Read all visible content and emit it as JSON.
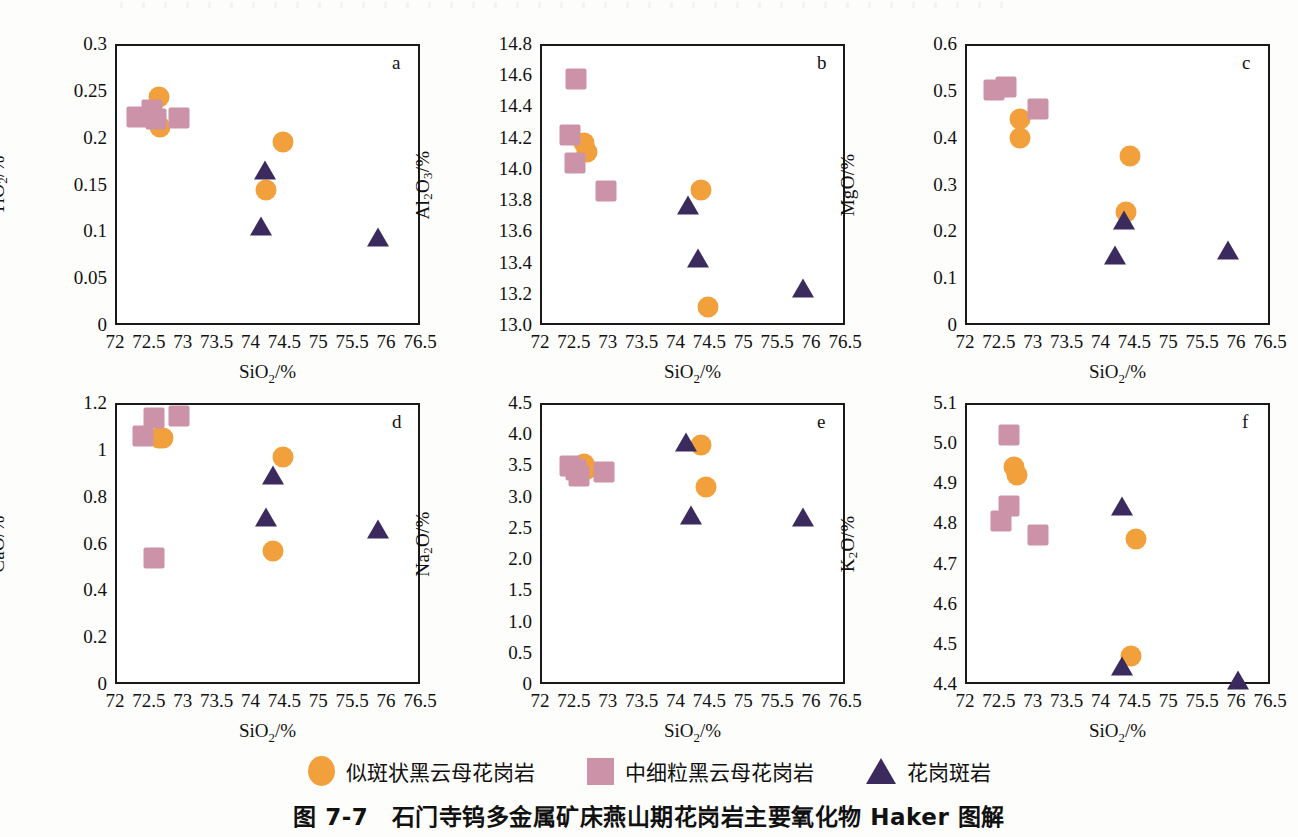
{
  "figure": {
    "caption": "图 7-7　石门寺钨多金属矿床燕山期花岗岩主要氧化物 Haker 图解"
  },
  "legend": {
    "items": [
      {
        "name": "circle-marker",
        "shape": "circle",
        "color": "#F2A03C",
        "label": "似斑状黑云母花岗岩"
      },
      {
        "name": "square-marker",
        "shape": "square",
        "color": "#CC92A8",
        "label": "中细粒黑云母花岗岩"
      },
      {
        "name": "triangle-marker",
        "shape": "triangle",
        "color": "#3B2A5E",
        "label": "花岗斑岩"
      }
    ]
  },
  "colors": {
    "porphyritic_biotite_granite": "#F2A03C",
    "medium_fine_biotite_granite": "#CC92A8",
    "granite_porphyry": "#3B2A5E",
    "axis": "#1a1a1a"
  },
  "chart_data": [
    {
      "id": "a",
      "type": "scatter",
      "letter": "a",
      "title": "",
      "xlabel": "SiO2/%",
      "ylabel": "TiO2/%",
      "xlim": [
        72,
        76.5
      ],
      "ylim": [
        0,
        0.3
      ],
      "xticks": [
        "72",
        "72.5",
        "73",
        "73.5",
        "74",
        "74.5",
        "75",
        "75.5",
        "76",
        "76.5"
      ],
      "xtick_values": [
        72,
        72.5,
        73,
        73.5,
        74,
        74.5,
        75,
        75.5,
        76,
        76.5
      ],
      "yticks": [
        "0",
        "0.05",
        "0.1",
        "0.15",
        "0.2",
        "0.25",
        "0.3"
      ],
      "ytick_values": [
        0,
        0.05,
        0.1,
        0.15,
        0.2,
        0.25,
        0.3
      ],
      "grid": false,
      "series": [
        {
          "name": "似斑状黑云母花岗岩",
          "marker": "circle",
          "color": "#F2A03C",
          "points": [
            [
              72.62,
              0.246
            ],
            [
              72.64,
              0.214
            ],
            [
              74.45,
              0.198
            ],
            [
              74.2,
              0.146
            ]
          ]
        },
        {
          "name": "中细粒黑云母花岗岩",
          "marker": "square",
          "color": "#CC92A8",
          "points": [
            [
              72.3,
              0.224
            ],
            [
              72.52,
              0.232
            ],
            [
              72.58,
              0.222
            ],
            [
              72.92,
              0.223
            ]
          ]
        },
        {
          "name": "花岗斑岩",
          "marker": "triangle",
          "color": "#3B2A5E",
          "points": [
            [
              74.18,
              0.171
            ],
            [
              74.12,
              0.111
            ],
            [
              75.85,
              0.099
            ]
          ]
        }
      ]
    },
    {
      "id": "b",
      "type": "scatter",
      "letter": "b",
      "title": "",
      "xlabel": "SiO2/%",
      "ylabel": "Al2O3/%",
      "xlim": [
        72,
        76.5
      ],
      "ylim": [
        13.0,
        14.8
      ],
      "xticks": [
        "72",
        "72.5",
        "73",
        "73.5",
        "74",
        "74.5",
        "75",
        "75.5",
        "76",
        "76.5"
      ],
      "xtick_values": [
        72,
        72.5,
        73,
        73.5,
        74,
        74.5,
        75,
        75.5,
        76,
        76.5
      ],
      "yticks": [
        "13.0",
        "13.2",
        "13.4",
        "13.6",
        "13.8",
        "14.0",
        "14.2",
        "14.4",
        "14.6",
        "14.8"
      ],
      "ytick_values": [
        13.0,
        13.2,
        13.4,
        13.6,
        13.8,
        14.0,
        14.2,
        14.4,
        14.6,
        14.8
      ],
      "grid": false,
      "series": [
        {
          "name": "似斑状黑云母花岗岩",
          "marker": "circle",
          "color": "#F2A03C",
          "points": [
            [
              72.62,
              14.18
            ],
            [
              72.66,
              14.12
            ],
            [
              74.35,
              13.88
            ],
            [
              74.45,
              13.13
            ]
          ]
        },
        {
          "name": "中细粒黑云母花岗岩",
          "marker": "square",
          "color": "#CC92A8",
          "points": [
            [
              72.5,
              14.59
            ],
            [
              72.42,
              14.23
            ],
            [
              72.48,
              14.05
            ],
            [
              72.95,
              13.87
            ]
          ]
        },
        {
          "name": "花岗斑岩",
          "marker": "triangle",
          "color": "#3B2A5E",
          "points": [
            [
              74.15,
              13.8
            ],
            [
              74.3,
              13.46
            ],
            [
              75.85,
              13.27
            ]
          ]
        }
      ]
    },
    {
      "id": "c",
      "type": "scatter",
      "letter": "c",
      "title": "",
      "xlabel": "SiO2/%",
      "ylabel": "MgO/%",
      "xlim": [
        72,
        76.5
      ],
      "ylim": [
        0,
        0.6
      ],
      "xticks": [
        "72",
        "72.5",
        "73",
        "73.5",
        "74",
        "74.5",
        "75",
        "75.5",
        "76",
        "76.5"
      ],
      "xtick_values": [
        72,
        72.5,
        73,
        73.5,
        74,
        74.5,
        75,
        75.5,
        76,
        76.5
      ],
      "yticks": [
        "0",
        "0.1",
        "0.2",
        "0.3",
        "0.4",
        "0.5",
        "0.6"
      ],
      "ytick_values": [
        0,
        0.1,
        0.2,
        0.3,
        0.4,
        0.5,
        0.6
      ],
      "grid": false,
      "series": [
        {
          "name": "似斑状黑云母花岗岩",
          "marker": "circle",
          "color": "#F2A03C",
          "points": [
            [
              72.78,
              0.445
            ],
            [
              72.78,
              0.403
            ],
            [
              74.4,
              0.366
            ],
            [
              74.35,
              0.245
            ]
          ]
        },
        {
          "name": "中细粒黑云母花岗岩",
          "marker": "square",
          "color": "#CC92A8",
          "points": [
            [
              72.4,
              0.507
            ],
            [
              72.58,
              0.513
            ],
            [
              73.05,
              0.466
            ]
          ]
        },
        {
          "name": "花岗斑岩",
          "marker": "triangle",
          "color": "#3B2A5E",
          "points": [
            [
              74.32,
              0.235
            ],
            [
              74.18,
              0.161
            ],
            [
              75.85,
              0.17
            ]
          ]
        }
      ]
    },
    {
      "id": "d",
      "type": "scatter",
      "letter": "d",
      "title": "",
      "xlabel": "SiO2/%",
      "ylabel": "CaO/%",
      "xlim": [
        72,
        76.5
      ],
      "ylim": [
        0,
        1.2
      ],
      "xticks": [
        "72",
        "72.5",
        "73",
        "73.5",
        "74",
        "74.5",
        "75",
        "75.5",
        "76",
        "76.5"
      ],
      "xtick_values": [
        72,
        72.5,
        73,
        73.5,
        74,
        74.5,
        75,
        75.5,
        76,
        76.5
      ],
      "yticks": [
        "0",
        "0.2",
        "0.4",
        "0.6",
        "0.8",
        "1",
        "1.2"
      ],
      "ytick_values": [
        0,
        0.2,
        0.4,
        0.6,
        0.8,
        1.0,
        1.2
      ],
      "grid": false,
      "series": [
        {
          "name": "似斑状黑云母花岗岩",
          "marker": "circle",
          "color": "#F2A03C",
          "points": [
            [
              72.62,
              1.06
            ],
            [
              72.68,
              1.06
            ],
            [
              74.45,
              0.978
            ],
            [
              74.3,
              0.578
            ]
          ]
        },
        {
          "name": "中细粒黑云母花岗岩",
          "marker": "square",
          "color": "#CC92A8",
          "points": [
            [
              72.55,
              1.145
            ],
            [
              72.38,
              1.068
            ],
            [
              72.92,
              1.152
            ],
            [
              72.55,
              0.545
            ]
          ]
        },
        {
          "name": "花岗斑岩",
          "marker": "triangle",
          "color": "#3B2A5E",
          "points": [
            [
              74.3,
              0.915
            ],
            [
              74.2,
              0.735
            ],
            [
              75.85,
              0.685
            ]
          ]
        }
      ]
    },
    {
      "id": "e",
      "type": "scatter",
      "letter": "e",
      "title": "",
      "xlabel": "SiO2/%",
      "ylabel": "Na2O/%",
      "xlim": [
        72,
        76.5
      ],
      "ylim": [
        0,
        4.5
      ],
      "xticks": [
        "72",
        "72.5",
        "73",
        "73.5",
        "74",
        "74.5",
        "75",
        "75.5",
        "76",
        "76.5"
      ],
      "xtick_values": [
        72,
        72.5,
        73,
        73.5,
        74,
        74.5,
        75,
        75.5,
        76,
        76.5
      ],
      "yticks": [
        "0",
        "0.5",
        "1.0",
        "1.5",
        "2.0",
        "2.5",
        "3.0",
        "3.5",
        "4.0",
        "4.5"
      ],
      "ytick_values": [
        0,
        0.5,
        1.0,
        1.5,
        2.0,
        2.5,
        3.0,
        3.5,
        4.0,
        4.5
      ],
      "grid": false,
      "series": [
        {
          "name": "似斑状黑云母花岗岩",
          "marker": "circle",
          "color": "#F2A03C",
          "points": [
            [
              72.62,
              3.55
            ],
            [
              72.66,
              3.47
            ],
            [
              74.35,
              3.86
            ],
            [
              74.42,
              3.19
            ]
          ]
        },
        {
          "name": "中细粒黑云母花岗岩",
          "marker": "square",
          "color": "#CC92A8",
          "points": [
            [
              72.42,
              3.52
            ],
            [
              72.55,
              3.36
            ],
            [
              72.92,
              3.42
            ],
            [
              72.5,
              3.46
            ]
          ]
        },
        {
          "name": "花岗斑岩",
          "marker": "triangle",
          "color": "#3B2A5E",
          "points": [
            [
              74.12,
              3.95
            ],
            [
              74.2,
              2.78
            ],
            [
              75.85,
              2.76
            ]
          ]
        }
      ]
    },
    {
      "id": "f",
      "type": "scatter",
      "letter": "f",
      "title": "",
      "xlabel": "SiO2/%",
      "ylabel": "K2O/%",
      "xlim": [
        72,
        76.5
      ],
      "ylim": [
        4.4,
        5.1
      ],
      "xticks": [
        "72",
        "72.5",
        "73",
        "73.5",
        "74",
        "74.5",
        "75",
        "75.5",
        "76",
        "76.5"
      ],
      "xtick_values": [
        72,
        72.5,
        73,
        73.5,
        74,
        74.5,
        75,
        75.5,
        76,
        76.5
      ],
      "yticks": [
        "4.4",
        "4.5",
        "4.6",
        "4.7",
        "4.8",
        "4.9",
        "5.0",
        "5.1"
      ],
      "ytick_values": [
        4.4,
        4.5,
        4.6,
        4.7,
        4.8,
        4.9,
        5.0,
        5.1
      ],
      "grid": false,
      "series": [
        {
          "name": "似斑状黑云母花岗岩",
          "marker": "circle",
          "color": "#F2A03C",
          "points": [
            [
              72.7,
              4.945
            ],
            [
              72.74,
              4.925
            ],
            [
              74.5,
              4.765
            ],
            [
              74.42,
              4.475
            ]
          ]
        },
        {
          "name": "中细粒黑云母花岗岩",
          "marker": "square",
          "color": "#CC92A8",
          "points": [
            [
              72.62,
              5.025
            ],
            [
              72.62,
              4.848
            ],
            [
              72.5,
              4.812
            ],
            [
              73.05,
              4.775
            ]
          ]
        },
        {
          "name": "花岗斑岩",
          "marker": "triangle",
          "color": "#3B2A5E",
          "points": [
            [
              74.28,
              4.855
            ],
            [
              74.28,
              4.458
            ],
            [
              76.0,
              4.422
            ]
          ]
        }
      ]
    }
  ]
}
